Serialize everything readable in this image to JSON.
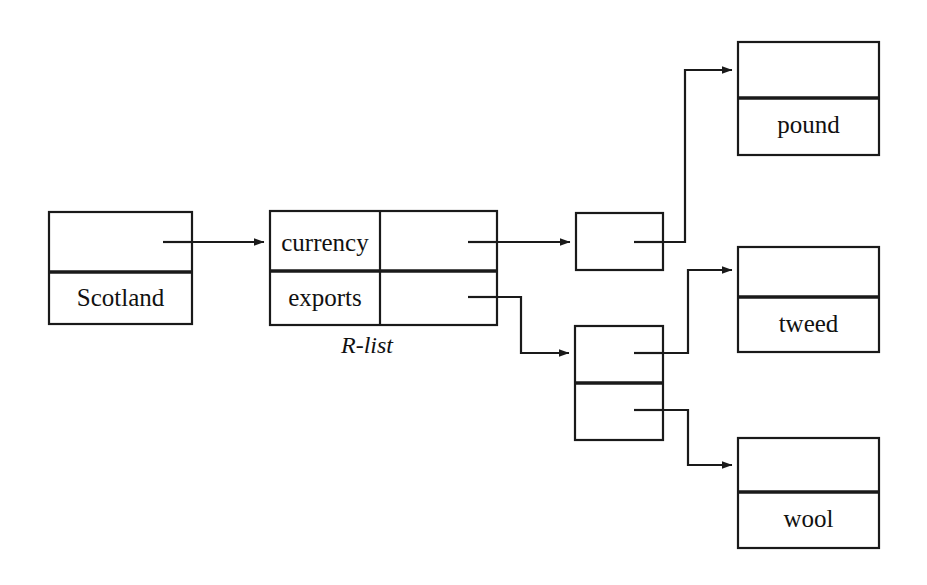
{
  "diagram": {
    "caption": "R-list",
    "stroke_color": "#1a1a1a",
    "background_color": "#ffffff",
    "nodes": [
      {
        "id": "scotland",
        "kind": "two-row-box",
        "pointer_label": "",
        "value_label": "Scotland",
        "x": 49,
        "y": 212,
        "width": 143,
        "height": 112,
        "divider_y": 272
      },
      {
        "id": "r-list",
        "kind": "two-by-two-table",
        "caption": "R-list",
        "row_labels": [
          "currency",
          "exports"
        ],
        "x": 270,
        "y": 211,
        "width": 227,
        "height": 114,
        "column_divider_x": 380,
        "row_divider_y": 271
      },
      {
        "id": "cons-currency",
        "kind": "single-cell-box",
        "pointer_label": "",
        "x": 576,
        "y": 213,
        "width": 87,
        "height": 57
      },
      {
        "id": "cons-exports",
        "kind": "two-row-cell-box",
        "pointer_label": "",
        "x": 575,
        "y": 326,
        "width": 88,
        "height": 114,
        "divider_y": 383
      },
      {
        "id": "pound",
        "kind": "two-row-box",
        "value_label": "pound",
        "x": 738,
        "y": 42,
        "width": 141,
        "height": 113,
        "divider_y": 98
      },
      {
        "id": "tweed",
        "kind": "two-row-box",
        "value_label": "tweed",
        "x": 738,
        "y": 247,
        "width": 141,
        "height": 105,
        "divider_y": 297
      },
      {
        "id": "wool",
        "kind": "two-row-box",
        "value_label": "wool",
        "x": 738,
        "y": 438,
        "width": 141,
        "height": 110,
        "divider_y": 492
      }
    ],
    "edges": [
      {
        "id": "scotland-to-rlist",
        "from": "scotland",
        "to": "r-list",
        "label": ""
      },
      {
        "id": "currency-to-cons",
        "from": "r-list.currency",
        "to": "cons-currency",
        "label": ""
      },
      {
        "id": "cons-currency-to-pound",
        "from": "cons-currency",
        "to": "pound",
        "label": ""
      },
      {
        "id": "exports-to-cons",
        "from": "r-list.exports",
        "to": "cons-exports",
        "label": ""
      },
      {
        "id": "cons-exports-to-tweed",
        "from": "cons-exports.head",
        "to": "tweed",
        "label": ""
      },
      {
        "id": "cons-exports-to-wool",
        "from": "cons-exports.tail",
        "to": "wool",
        "label": ""
      }
    ]
  },
  "labels": {
    "scotland": "Scotland",
    "currency": "currency",
    "exports": "exports",
    "pound": "pound",
    "tweed": "tweed",
    "wool": "wool",
    "rlist_caption": "R-list"
  }
}
